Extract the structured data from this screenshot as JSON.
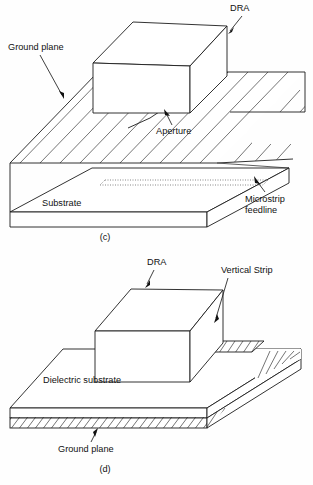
{
  "figure": {
    "panels": [
      {
        "id": "c",
        "caption": "(c)",
        "description": "Aperture-coupled DRA fed by a microstrip feedline through a slot in the ground plane",
        "labels": [
          {
            "name": "dra",
            "text": "DRA"
          },
          {
            "name": "ground-plane",
            "text": "Ground plane"
          },
          {
            "name": "aperture",
            "text": "Aperture"
          },
          {
            "name": "microstrip-feedline-line1",
            "text": "Microstrip"
          },
          {
            "name": "microstrip-feedline-line2",
            "text": "feedline"
          },
          {
            "name": "substrate",
            "text": "Substrate"
          }
        ]
      },
      {
        "id": "d",
        "caption": "(d)",
        "description": "DRA fed by a vertical conducting strip on a dielectric substrate backed by a ground plane",
        "labels": [
          {
            "name": "dra",
            "text": "DRA"
          },
          {
            "name": "vertical-strip",
            "text": "Vertical Strip"
          },
          {
            "name": "dielectric-substrate",
            "text": "Dielectric substrate"
          },
          {
            "name": "ground-plane",
            "text": "Ground plane"
          }
        ]
      }
    ],
    "colors": {
      "ink": "#1c1c1c",
      "hatch": "#3a3a3a",
      "hidden_edge": "#8c8c8c",
      "background": "#ffffff"
    }
  }
}
